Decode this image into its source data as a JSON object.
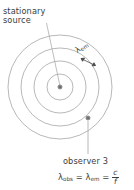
{
  "figure": {
    "kind": "physics-wavefront-diagram",
    "background_color": "#ffffff",
    "line_color": "#9a9a9a",
    "text_color": "#3d3d3d"
  },
  "labels": {
    "source_line1": "stationary",
    "source_line2": "source",
    "wavelength_emitted": "λ",
    "wavelength_emitted_sub": "em",
    "observer_title": "observer 3"
  },
  "formula": {
    "lambda_obs": "λ",
    "lambda_obs_sub": "obs",
    "equals_1": "=",
    "lambda_em": "λ",
    "lambda_em_sub": "em",
    "equals_2": "=",
    "numerator": "c",
    "denominator": "f"
  },
  "geometry": {
    "center_x": 60,
    "center_y": 87,
    "wavefront_radii": [
      13,
      26,
      39,
      52
    ],
    "wavefront_count": 4,
    "source_dot": {
      "x": 60,
      "y": 87,
      "r": 2.1
    },
    "observer_dot": {
      "x": 88,
      "y": 118,
      "r": 2.1
    },
    "source_leader": {
      "x1": 46,
      "y1": 23,
      "x2": 60,
      "y2": 86
    },
    "observer_leader": {
      "x1": 88,
      "y1": 121,
      "x2": 88,
      "y2": 154
    },
    "wavelength_arrow": {
      "x1": 80,
      "y1": 58,
      "x2": 96,
      "y2": 66
    }
  }
}
